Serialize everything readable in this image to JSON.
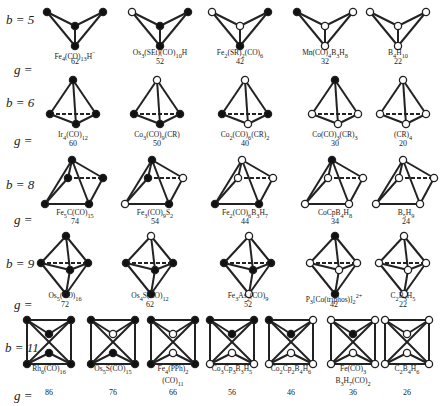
{
  "figure": {
    "rows": [
      {
        "b_label": "b = 5",
        "g_label": "g =",
        "geometry": "butterfly",
        "clusters": [
          {
            "formula_html": "Fe<sub>4</sub>(CO)<sub>13</sub>H<sup>−</sup>",
            "formula": "Fe4(CO)13H−",
            "g": "62",
            "vertices": [
              "filled",
              "filled",
              "filled",
              "filled"
            ]
          },
          {
            "formula_html": "Os<sub>3</sub>(SEt)(CO)<sub>10</sub>H",
            "formula": "Os3(SEt)(CO)10H",
            "g": "52",
            "vertices": [
              "open",
              "filled",
              "filled",
              "filled"
            ]
          },
          {
            "formula_html": "Fe<sub>2</sub>(SR)<sub>2</sub>(CO)<sub>6</sub>",
            "formula": "Fe2(SR)2(CO)6",
            "g": "42",
            "vertices": [
              "open",
              "filled",
              "open",
              "filled"
            ]
          },
          {
            "formula_html": "Mn(CO)<sub>4</sub>B<sub>3</sub>H<sub>8</sub>",
            "formula": "Mn(CO)4B3H8",
            "g": "32",
            "vertices": [
              "filled",
              "open",
              "open",
              "open"
            ]
          },
          {
            "formula_html": "B<sub>4</sub>H<sub>10</sub>",
            "formula": "B4H10",
            "g": "22",
            "vertices": [
              "open",
              "open",
              "open",
              "open"
            ]
          }
        ]
      },
      {
        "b_label": "b = 6",
        "g_label": "g =",
        "geometry": "tetrahedron",
        "clusters": [
          {
            "formula_html": "Ir<sub>4</sub>(CO)<sub>12</sub>",
            "formula": "Ir4(CO)12",
            "g": "60",
            "vertices": [
              "filled",
              "filled",
              "filled",
              "filled"
            ]
          },
          {
            "formula_html": "Co<sub>3</sub>(CO)<sub>9</sub>(CR)",
            "formula": "Co3(CO)9(CR)",
            "g": "50",
            "vertices": [
              "open",
              "filled",
              "filled",
              "filled"
            ]
          },
          {
            "formula_html": "Co<sub>2</sub>(CO)<sub>6</sub>(CR)<sub>2</sub>",
            "formula": "Co2(CO)6(CR)2",
            "g": "40",
            "vertices": [
              "open",
              "filled",
              "filled",
              "open"
            ]
          },
          {
            "formula_html": "Co(CO)<sub>3</sub>(CR)<sub>3</sub>",
            "formula": "Co(CO)3(CR)3",
            "g": "30",
            "vertices": [
              "filled",
              "open",
              "open",
              "open"
            ]
          },
          {
            "formula_html": "(CR)<sub>4</sub>",
            "formula": "(CR)4",
            "g": "20",
            "vertices": [
              "open",
              "open",
              "open",
              "open"
            ]
          }
        ]
      },
      {
        "b_label": "b = 8",
        "g_label": "g =",
        "geometry": "square-pyramid",
        "clusters": [
          {
            "formula_html": "Fe<sub>5</sub>C(CO)<sub>15</sub>",
            "formula": "Fe5C(CO)15",
            "g": "74",
            "vertices": [
              "filled",
              "filled",
              "filled",
              "filled",
              "filled"
            ]
          },
          {
            "formula_html": "Fe<sub>3</sub>(CO)<sub>9</sub>S<sub>2</sub>",
            "formula": "Fe3(CO)9S2",
            "g": "54",
            "vertices": [
              "filled",
              "open",
              "filled",
              "filled",
              "open"
            ]
          },
          {
            "formula_html": "Fe<sub>2</sub>(CO)<sub>6</sub>B<sub>3</sub>H<sub>7</sub>",
            "formula": "Fe2(CO)6B3H7",
            "g": "44",
            "vertices": [
              "open",
              "filled",
              "open",
              "filled",
              "open"
            ]
          },
          {
            "formula_html": "CoCpB<sub>4</sub>H<sub>8</sub>",
            "formula": "CoCpB4H8",
            "g": "34",
            "vertices": [
              "filled",
              "open",
              "open",
              "open",
              "open"
            ]
          },
          {
            "formula_html": "B<sub>5</sub>H<sub>9</sub>",
            "formula": "B5H9",
            "g": "24",
            "vertices": [
              "open",
              "open",
              "open",
              "open",
              "open"
            ]
          }
        ]
      },
      {
        "b_label": "b = 9",
        "g_label": "g =",
        "geometry": "trigonal-bipyramid",
        "clusters": [
          {
            "formula_html": "Os<sub>5</sub>(CO)<sub>16</sub>",
            "formula": "Os5(CO)16",
            "g": "72",
            "vertices": [
              "filled",
              "filled",
              "filled",
              "filled",
              "filled"
            ]
          },
          {
            "formula_html": "Os<sub>4</sub>S(CO)<sub>12</sub>",
            "formula": "Os4S(CO)12",
            "g": "62",
            "vertices": [
              "open",
              "filled",
              "filled",
              "filled",
              "filled"
            ]
          },
          {
            "formula_html": "Fe<sub>3</sub>As<sub>2</sub>(CO)<sub>9</sub>",
            "formula": "Fe3As2(CO)9",
            "g": "52",
            "vertices": [
              "open",
              "filled",
              "filled",
              "filled",
              "open"
            ]
          },
          {
            "formula_html": "P<sub>3</sub>[Co(triphos)]<sub>2</sub><sup>2+</sup>",
            "formula": "P3[Co(triphos)]2 2+",
            "g": "42",
            "vertices": [
              "filled",
              "open",
              "open",
              "open",
              "filled"
            ]
          },
          {
            "formula_html": "C<sub>2</sub>B<sub>3</sub>H<sub>5</sub>",
            "formula": "C2B3H5",
            "g": "22",
            "vertices": [
              "open",
              "open",
              "open",
              "open",
              "open"
            ]
          }
        ]
      },
      {
        "b_label": "b = 11",
        "g_label": "g =",
        "geometry": "trigonal-prism-capped",
        "clusters": [
          {
            "formula_html": "Rh<sub>6</sub>(CO)<sub>16</sub>",
            "formula": "Rh6(CO)16",
            "g": "86",
            "vertices": [
              "filled",
              "filled",
              "filled",
              "filled",
              "filled",
              "filled"
            ]
          },
          {
            "formula_html": "Os<sub>5</sub>S(CO)<sub>15</sub>",
            "formula": "Os5S(CO)15",
            "g": "76",
            "vertices": [
              "filled",
              "filled",
              "filled",
              "filled",
              "open",
              "filled"
            ]
          },
          {
            "formula_html": "Fe<sub>4</sub>(PPh)<sub>2</sub><br>(CO)<sub>11</sub>",
            "formula": "Fe4(PPh)2(CO)11",
            "g": "66",
            "vertices": [
              "filled",
              "filled",
              "filled",
              "filled",
              "open",
              "open"
            ]
          },
          {
            "formula_html": "Co<sub>3</sub>Cp<sub>3</sub>B<sub>3</sub>H<sub>5</sub>",
            "formula": "Co3Cp3B3H5",
            "g": "56",
            "vertices": [
              "filled",
              "filled",
              "open",
              "open",
              "filled",
              "open"
            ]
          },
          {
            "formula_html": "Co<sub>2</sub>Cp<sub>2</sub>B<sub>4</sub>H<sub>6</sub>",
            "formula": "Co2Cp2B4H6",
            "g": "46",
            "vertices": [
              "filled",
              "open",
              "open",
              "open",
              "filled",
              "open"
            ]
          },
          {
            "formula_html": "Fe(CO)<sub>3</sub><br>B<sub>3</sub>H<sub>7</sub>(CO)<sub>2</sub>",
            "formula": "Fe(CO)3B3H7(CO)2",
            "g": "36",
            "vertices": [
              "open",
              "open",
              "open",
              "open",
              "filled",
              "open"
            ]
          },
          {
            "formula_html": "C<sub>2</sub>B<sub>4</sub>H<sub>6</sub>",
            "formula": "C2B4H6",
            "g": "26",
            "vertices": [
              "open",
              "open",
              "open",
              "open",
              "open",
              "open"
            ]
          }
        ]
      }
    ],
    "legend_colors": {
      "filled": "#111111",
      "open": "#ffffff",
      "edge": "#222222"
    }
  }
}
